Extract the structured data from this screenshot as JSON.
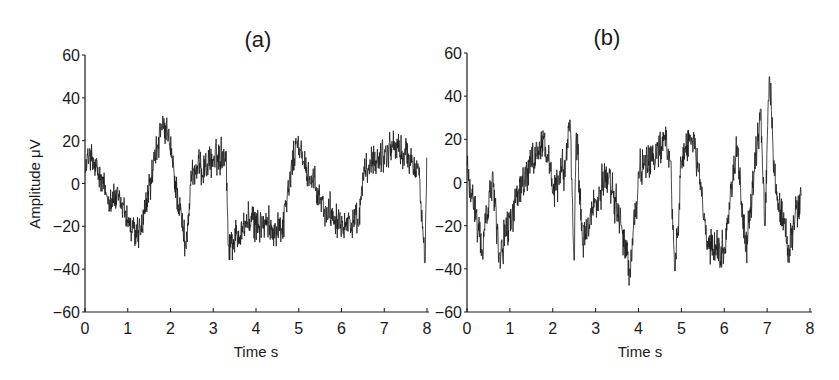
{
  "chart_data": [
    {
      "type": "line",
      "title": "(a)",
      "xlabel": "Time s",
      "ylabel": "Amplitude μV",
      "xlim": [
        0,
        8
      ],
      "ylim": [
        -60,
        60
      ],
      "xticks": [
        0,
        1,
        2,
        3,
        4,
        5,
        6,
        7,
        8
      ],
      "yticks": [
        60,
        40,
        20,
        0,
        -20,
        -40,
        -60
      ],
      "xtick_labels": [
        "0",
        "1",
        "2",
        "3",
        "4",
        "5",
        "6",
        "7",
        "8"
      ],
      "ytick_labels": [
        "60",
        "40",
        "20",
        "0",
        "−20",
        "−40",
        "−60"
      ],
      "grid": false,
      "legend": null,
      "description": "Low-amplitude EEG-like noise trace, mostly within roughly ±15 μV",
      "key_points_note": "Approximate peaks/troughs read from the image; values are estimates.",
      "key_points": [
        {
          "t": 0.0,
          "v": 5
        },
        {
          "t": 0.1,
          "v": 13
        },
        {
          "t": 0.5,
          "v": -5
        },
        {
          "t": 0.9,
          "v": -10
        },
        {
          "t": 1.1,
          "v": -23
        },
        {
          "t": 1.3,
          "v": -24
        },
        {
          "t": 1.7,
          "v": 18
        },
        {
          "t": 1.8,
          "v": 25
        },
        {
          "t": 1.95,
          "v": 21
        },
        {
          "t": 2.35,
          "v": -29
        },
        {
          "t": 2.5,
          "v": 4
        },
        {
          "t": 3.3,
          "v": 15
        },
        {
          "t": 3.35,
          "v": -29
        },
        {
          "t": 3.8,
          "v": -18
        },
        {
          "t": 4.6,
          "v": -21
        },
        {
          "t": 4.95,
          "v": 19
        },
        {
          "t": 5.1,
          "v": 10
        },
        {
          "t": 5.6,
          "v": -12
        },
        {
          "t": 6.4,
          "v": -20
        },
        {
          "t": 6.5,
          "v": 5
        },
        {
          "t": 7.2,
          "v": 18
        },
        {
          "t": 7.8,
          "v": 8
        },
        {
          "t": 7.95,
          "v": -37
        },
        {
          "t": 8.0,
          "v": 12
        }
      ],
      "samples_note": "Plotted samples are synthesized (seeded noise anchored to key_points), not measured from the figure.",
      "synthetic": true,
      "seed": 12345,
      "noise_amp": 9,
      "n_samples": 1200
    },
    {
      "type": "line",
      "title": "(b)",
      "xlabel": "Time s",
      "ylabel": "",
      "xlim": [
        0,
        8
      ],
      "ylim": [
        -60,
        60
      ],
      "xticks": [
        0,
        1,
        2,
        3,
        4,
        5,
        6,
        7,
        8
      ],
      "yticks": [
        60,
        40,
        20,
        0,
        -20,
        -40,
        -60
      ],
      "xtick_labels": [
        "0",
        "1",
        "2",
        "3",
        "4",
        "5",
        "6",
        "7",
        "8"
      ],
      "ytick_labels": [
        "60",
        "40",
        "20",
        "0",
        "−20",
        "−40",
        "−60"
      ],
      "grid": false,
      "legend": null,
      "description": "Higher-amplitude EEG-like trace with large transients, peak ~49 μV near 7 s",
      "key_points_note": "Approximate peaks/troughs read from the image; values are estimates.",
      "key_points": [
        {
          "t": 0.0,
          "v": 8
        },
        {
          "t": 0.1,
          "v": -5
        },
        {
          "t": 0.35,
          "v": -31
        },
        {
          "t": 0.6,
          "v": 5
        },
        {
          "t": 0.75,
          "v": -33
        },
        {
          "t": 0.9,
          "v": -25
        },
        {
          "t": 1.2,
          "v": -5
        },
        {
          "t": 1.5,
          "v": 8
        },
        {
          "t": 1.8,
          "v": 21
        },
        {
          "t": 2.0,
          "v": -5
        },
        {
          "t": 2.3,
          "v": 10
        },
        {
          "t": 2.4,
          "v": 29
        },
        {
          "t": 2.5,
          "v": -36
        },
        {
          "t": 2.55,
          "v": 23
        },
        {
          "t": 2.7,
          "v": -29
        },
        {
          "t": 3.0,
          "v": -8
        },
        {
          "t": 3.3,
          "v": 2
        },
        {
          "t": 3.6,
          "v": -20
        },
        {
          "t": 3.8,
          "v": -40
        },
        {
          "t": 4.0,
          "v": 5
        },
        {
          "t": 4.3,
          "v": 10
        },
        {
          "t": 4.6,
          "v": 20
        },
        {
          "t": 4.75,
          "v": 10
        },
        {
          "t": 4.85,
          "v": -41
        },
        {
          "t": 5.0,
          "v": 10
        },
        {
          "t": 5.2,
          "v": 22
        },
        {
          "t": 5.4,
          "v": 5
        },
        {
          "t": 5.6,
          "v": -31
        },
        {
          "t": 6.0,
          "v": -30
        },
        {
          "t": 6.3,
          "v": 17
        },
        {
          "t": 6.5,
          "v": -32
        },
        {
          "t": 6.7,
          "v": 5
        },
        {
          "t": 6.85,
          "v": 34
        },
        {
          "t": 6.95,
          "v": -20
        },
        {
          "t": 7.05,
          "v": 49
        },
        {
          "t": 7.2,
          "v": -5
        },
        {
          "t": 7.5,
          "v": -29
        },
        {
          "t": 7.8,
          "v": -6
        }
      ],
      "samples_note": "Plotted samples are synthesized (seeded noise anchored to key_points), not measured from the figure.",
      "synthetic": true,
      "seed": 67890,
      "noise_amp": 10,
      "n_samples": 1170
    }
  ],
  "panels": [
    {
      "title": "(a)",
      "ylabel": "Amplitude μV",
      "xlabel": "Time s"
    },
    {
      "title": "(b)",
      "xlabel": "Time s"
    }
  ],
  "colors": {
    "trace": "#1a1a1a",
    "axis": "#1a1a1a",
    "background": "#ffffff"
  }
}
